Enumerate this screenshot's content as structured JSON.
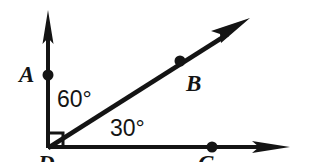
{
  "figure": {
    "kind": "geometry-angle-diagram",
    "background_color": "#ffffff",
    "stroke_color": "#141414",
    "width": 318,
    "height": 162,
    "vertex": {
      "x": 48,
      "y": 148,
      "label": "D"
    },
    "rays": [
      {
        "name": "vertical-ray",
        "from": {
          "x": 48,
          "y": 148
        },
        "to": {
          "x": 48,
          "y": 12
        },
        "arrow": true,
        "point": {
          "name": "A",
          "x": 48,
          "y": 75
        }
      },
      {
        "name": "diagonal-ray",
        "from": {
          "x": 48,
          "y": 148
        },
        "to": {
          "x": 247,
          "y": 22
        },
        "arrow": true,
        "point": {
          "name": "B",
          "x": 180,
          "y": 61
        }
      },
      {
        "name": "horizontal-ray",
        "from": {
          "x": 48,
          "y": 148
        },
        "to": {
          "x": 290,
          "y": 148
        },
        "arrow": true,
        "point": {
          "name": "C",
          "x": 212,
          "y": 148
        }
      }
    ],
    "right_angle_marker": {
      "name": "right-angle-square",
      "x": 48,
      "y": 148,
      "size": 15
    },
    "point_labels": {
      "A": "A",
      "B": "B",
      "C": "C",
      "D": "D"
    },
    "angle_labels": {
      "upper": "60°",
      "lower": "30°"
    },
    "angle_values": {
      "upper_degrees": 60,
      "lower_degrees": 30,
      "total_degrees": 90
    }
  }
}
